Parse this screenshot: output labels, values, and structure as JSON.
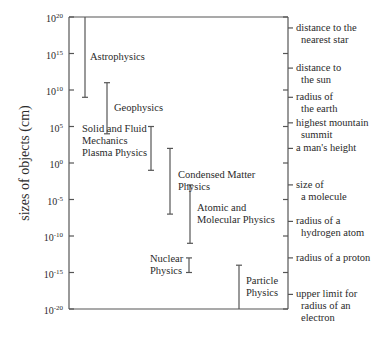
{
  "chart_data": {
    "type": "range",
    "title": "",
    "ylabel": "sizes of objects (cm)",
    "yscale": "log10",
    "ylim": [
      -20,
      20
    ],
    "y_ticks": [
      {
        "exp": "20",
        "value": 20
      },
      {
        "exp": "15",
        "value": 15
      },
      {
        "exp": "10",
        "value": 10
      },
      {
        "exp": "5",
        "value": 5
      },
      {
        "exp": "0",
        "value": 0
      },
      {
        "exp": "-5",
        "value": -5
      },
      {
        "exp": "-10",
        "value": -10
      },
      {
        "exp": "-15",
        "value": -15
      },
      {
        "exp": "-20",
        "value": -20
      }
    ],
    "ranges": [
      {
        "name": "Astrophysics",
        "lines": [
          "Astrophysics"
        ],
        "low": 9,
        "high": 20
      },
      {
        "name": "Geophysics",
        "lines": [
          "Geophysics"
        ],
        "low": 4,
        "high": 11
      },
      {
        "name": "Solid and Fluid Mechanics Plasma Physics",
        "lines": [
          "Solid and Fluid",
          "Mechanics",
          "Plasma Physics"
        ],
        "low": -1,
        "high": 5
      },
      {
        "name": "Condensed Matter Physics",
        "lines": [
          "Condensed Matter",
          "Physics"
        ],
        "low": -7,
        "high": 2
      },
      {
        "name": "Atomic and Molecular Physics",
        "lines": [
          "Atomic and",
          "Molecular Physics"
        ],
        "low": -11,
        "high": -3
      },
      {
        "name": "Nuclear Physics",
        "lines": [
          "Nuclear",
          "Physics"
        ],
        "low": -15,
        "high": -13
      },
      {
        "name": "Particle Physics",
        "lines": [
          "Particle",
          "Physics"
        ],
        "low": -20,
        "high": -14
      }
    ],
    "reference_objects": [
      {
        "lines": [
          "distance to the",
          "nearest star"
        ],
        "value": 18.5
      },
      {
        "lines": [
          "distance to",
          "the sun"
        ],
        "value": 13
      },
      {
        "lines": [
          "radius of",
          "the earth"
        ],
        "value": 9
      },
      {
        "lines": [
          "highest mountain",
          "summit"
        ],
        "value": 5.5
      },
      {
        "lines": [
          "a man's height"
        ],
        "value": 2
      },
      {
        "lines": [
          "size of",
          "a molecule"
        ],
        "value": -3
      },
      {
        "lines": [
          "radius of a",
          "hydrogen atom"
        ],
        "value": -8
      },
      {
        "lines": [
          "radius of a proton"
        ],
        "value": -13
      },
      {
        "lines": [
          "upper limit for",
          "radius of an",
          "electron"
        ],
        "value": -18
      }
    ],
    "grid": false,
    "legend": "none"
  }
}
